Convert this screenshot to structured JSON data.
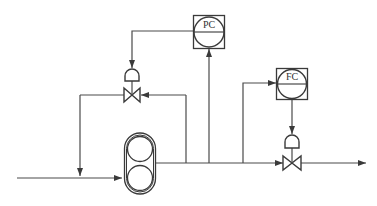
{
  "diagram": {
    "type": "process-control-diagram",
    "controllers": [
      {
        "id": "pc",
        "label": "PC",
        "meaning": "pressure controller"
      },
      {
        "id": "fc",
        "label": "FC",
        "meaning": "flow controller"
      }
    ],
    "equipment": [
      {
        "id": "pump",
        "label": "",
        "type": "rotary pump (lobe)"
      },
      {
        "id": "bypass-valve",
        "label": "",
        "type": "control valve with diaphragm actuator",
        "controlled_by": "pc"
      },
      {
        "id": "discharge-valve",
        "label": "",
        "type": "control valve with diaphragm actuator",
        "controlled_by": "fc"
      }
    ],
    "colors": {
      "line": "#4a4a4a",
      "background": "#ffffff"
    }
  }
}
